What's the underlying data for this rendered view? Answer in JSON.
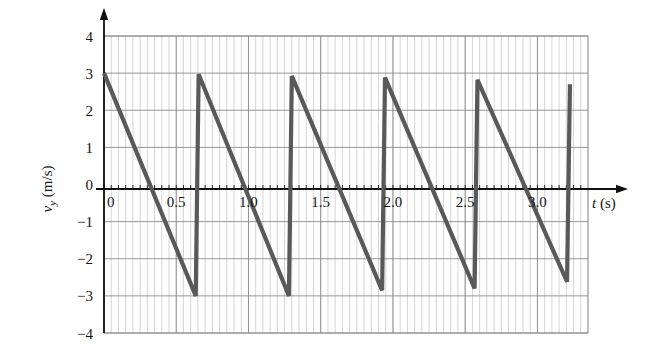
{
  "figure": {
    "name": "velocity-time-sawtooth-graph",
    "background": "#ffffff"
  },
  "axes": {
    "x_title_var": "t",
    "x_title_unit": " (s)",
    "y_title_var": "v",
    "y_title_sub": "y",
    "y_title_unit": " (m/s)"
  },
  "x_ticks": [
    {
      "value": 0,
      "label": "0"
    },
    {
      "value": 0.5,
      "label": "0.5"
    },
    {
      "value": 1.0,
      "label": "1.0"
    },
    {
      "value": 1.5,
      "label": "1.5"
    },
    {
      "value": 2.0,
      "label": "2.0"
    },
    {
      "value": 2.5,
      "label": "2.5"
    },
    {
      "value": 3.0,
      "label": "3.0"
    }
  ],
  "y_ticks": [
    {
      "value": 4,
      "label": "4"
    },
    {
      "value": 3,
      "label": "3"
    },
    {
      "value": 2,
      "label": "2"
    },
    {
      "value": 1,
      "label": "1"
    },
    {
      "value": 0,
      "label": "0"
    },
    {
      "value": -1,
      "label": "−1"
    },
    {
      "value": -2,
      "label": "−2"
    },
    {
      "value": -3,
      "label": "−3"
    },
    {
      "value": -4,
      "label": "−4"
    }
  ],
  "colors": {
    "curve": "#595959",
    "major_grid": "#8a8a8a",
    "minor_grid": "#c9c9c9",
    "axis": "#111111",
    "text": "#161616"
  },
  "chart_data": {
    "type": "line",
    "title": "",
    "subtitle": "",
    "xlabel": "t (s)",
    "ylabel": "v_y (m/s)",
    "xlim": [
      0,
      3.35
    ],
    "ylim": [
      -4,
      4
    ],
    "grid": true,
    "legend_position": "none",
    "x_major_step": 0.5,
    "x_minor_step": 0.05,
    "y_major_step": 1,
    "waveform": {
      "shape": "sawtooth",
      "period": 0.64,
      "v_max": 3.0,
      "v_min": -3.0,
      "slope": -9.4,
      "start_value": 3.0
    },
    "series": [
      {
        "name": "v_y",
        "points": [
          [
            0.0,
            3.0
          ],
          [
            0.635,
            -3.0
          ],
          [
            0.655,
            2.97
          ],
          [
            1.28,
            -3.0
          ],
          [
            1.3,
            2.92
          ],
          [
            1.925,
            -2.85
          ],
          [
            1.945,
            2.88
          ],
          [
            2.565,
            -2.8
          ],
          [
            2.585,
            2.82
          ],
          [
            3.205,
            -2.62
          ],
          [
            3.225,
            2.7
          ]
        ]
      }
    ]
  }
}
